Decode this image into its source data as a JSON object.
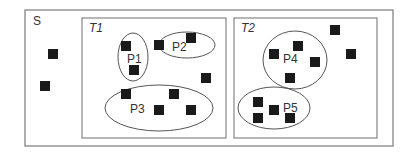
{
  "diagram": {
    "outer_set": {
      "label": "S",
      "x": 25,
      "y": 10,
      "w": 368,
      "h": 136
    },
    "loose_elements": [
      {
        "x": 53,
        "y": 54
      },
      {
        "x": 45,
        "y": 86
      }
    ],
    "subsets": [
      {
        "label": "T1",
        "x": 82,
        "y": 18,
        "w": 144,
        "h": 120,
        "loose_elements": [
          {
            "x": 206,
            "y": 78
          }
        ],
        "partitions": [
          {
            "label": "P1",
            "cx": 133,
            "cy": 57,
            "rx": 15,
            "ry": 24,
            "lx": 127,
            "ly": 63,
            "elements": [
              {
                "x": 126,
                "y": 46
              },
              {
                "x": 134,
                "y": 70
              }
            ]
          },
          {
            "label": "P2",
            "cx": 187,
            "cy": 45,
            "rx": 28,
            "ry": 13,
            "lx": 172,
            "ly": 51,
            "elements": [
              {
                "x": 159,
                "y": 45
              },
              {
                "x": 191,
                "y": 38
              }
            ]
          },
          {
            "label": "P3",
            "cx": 159,
            "cy": 108,
            "rx": 54,
            "ry": 23,
            "lx": 130,
            "ly": 113,
            "elements": [
              {
                "x": 126,
                "y": 94
              },
              {
                "x": 174,
                "y": 94
              },
              {
                "x": 159,
                "y": 110
              },
              {
                "x": 191,
                "y": 110
              }
            ]
          }
        ]
      },
      {
        "label": "T2",
        "x": 234,
        "y": 18,
        "w": 143,
        "h": 120,
        "loose_elements": [
          {
            "x": 335,
            "y": 30
          },
          {
            "x": 351,
            "y": 54
          }
        ],
        "partitions": [
          {
            "label": "P4",
            "cx": 295,
            "cy": 60,
            "rx": 32,
            "ry": 29,
            "lx": 283,
            "ly": 63,
            "elements": [
              {
                "x": 274,
                "y": 54
              },
              {
                "x": 298,
                "y": 46
              },
              {
                "x": 315,
                "y": 62
              },
              {
                "x": 290,
                "y": 78
              }
            ]
          },
          {
            "label": "P5",
            "cx": 274,
            "cy": 108,
            "rx": 36,
            "ry": 21,
            "lx": 283,
            "ly": 112,
            "elements": [
              {
                "x": 258,
                "y": 102
              },
              {
                "x": 274,
                "y": 110
              },
              {
                "x": 258,
                "y": 118
              },
              {
                "x": 290,
                "y": 118
              }
            ]
          }
        ]
      }
    ],
    "colors": {
      "element": "#1a1a1a",
      "stroke": "#6e6e6e"
    }
  }
}
